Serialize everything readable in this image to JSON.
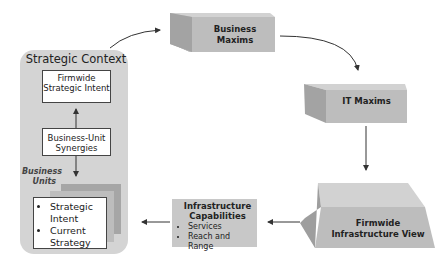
{
  "diagram": {
    "strategic_context": {
      "title": "Strategic Context",
      "firmwide_strategic_intent": "Firmwide Strategic Intent",
      "business_unit_synergies": "Business-Unit Synergies",
      "business_units_label": "Business Units",
      "business_unit_items": [
        "Strategic Intent",
        "Current Strategy"
      ]
    },
    "business_maxims": "Business Maxims",
    "it_maxims": "IT Maxims",
    "firmwide_infrastructure_view": "Firmwide Infrastructure View",
    "infrastructure_capabilities": {
      "title": "Infrastructure Capabilities",
      "items": [
        "Services",
        "Reach and Range"
      ]
    },
    "colors": {
      "panel": "#d4d4d4",
      "cube_front": "#bebebe",
      "cube_top": "#d2d2d2",
      "cube_side": "#9e9e9e",
      "arrow": "#333333"
    }
  }
}
